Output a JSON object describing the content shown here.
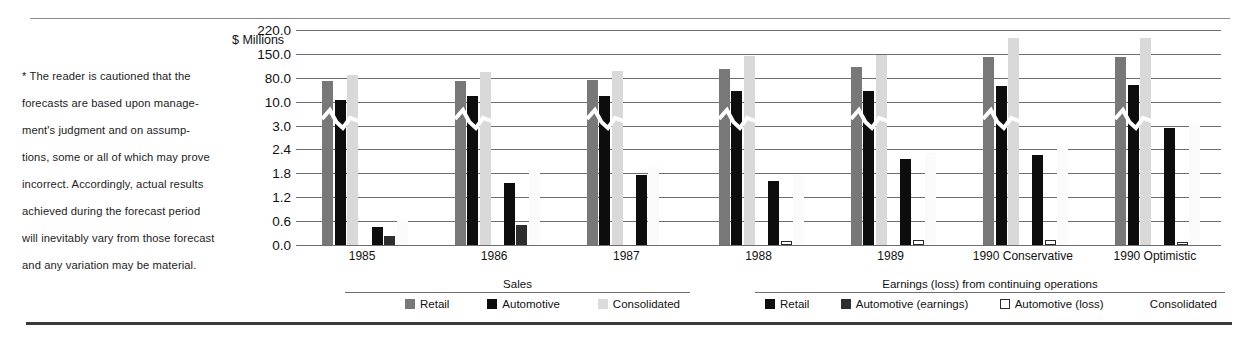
{
  "note": {
    "lines": [
      "* The reader is cautioned that the",
      "forecasts are based upon manage-",
      "ment's judgment and on assump-",
      "tions, some or all of which may prove",
      "incorrect. Accordingly, actual results",
      "achieved during the forecast period",
      "will inevitably vary from those forecast",
      "and any variation may be material."
    ]
  },
  "axis_unit_label": "$ Millions",
  "legends": {
    "sales": {
      "title": "Sales",
      "items": [
        {
          "label": "Retail",
          "swatch": "sw-retail-sales",
          "color": "#787878"
        },
        {
          "label": "Automotive",
          "swatch": "sw-auto-sales",
          "color": "#0d0d0d"
        },
        {
          "label": "Consolidated",
          "swatch": "sw-cons-sales",
          "color": "#dcdcdc"
        }
      ]
    },
    "earnings": {
      "title": "Earnings (loss) from continuing operations",
      "items": [
        {
          "label": "Retail",
          "swatch": "sw-retail-earn",
          "color": "#0d0d0d"
        },
        {
          "label": "Automotive (earnings)",
          "swatch": "sw-auto-earn",
          "color": "#2e2e2e"
        },
        {
          "label": "Automotive (loss)",
          "swatch": "sw-loss-earn",
          "color": "#ffffff"
        },
        {
          "label": "Consolidated",
          "swatch": "sw-cons-earn",
          "color": "#ffffff"
        }
      ]
    }
  },
  "chart_data": {
    "type": "bar",
    "title": "",
    "xlabel": "",
    "ylabel": "$ Millions",
    "grid": true,
    "legend_position": "bottom",
    "axis_note": "broken (non-linear) y axis; gridlines evenly spaced",
    "ytick_labels": [
      "220.0",
      "150.0",
      "80.0",
      "10.0",
      "3.0",
      "2.4",
      "1.8",
      "1.2",
      "0.6",
      "0.0"
    ],
    "ytick_values": [
      220.0,
      150.0,
      80.0,
      10.0,
      3.0,
      2.4,
      1.8,
      1.2,
      0.6,
      0.0
    ],
    "categories": [
      "1985",
      "1986",
      "1987",
      "1988",
      "1989",
      "1990 Conservative",
      "1990 Optimistic"
    ],
    "series": [
      {
        "name": "Sales - Retail",
        "group": "sales",
        "class": "b-sales-retail",
        "values": [
          72,
          70,
          73,
          105,
          112,
          140,
          140
        ]
      },
      {
        "name": "Sales - Automotive",
        "group": "sales",
        "class": "b-sales-auto",
        "values": [
          16,
          28,
          26,
          40,
          40,
          56,
          58
        ]
      },
      {
        "name": "Sales - Consolidated",
        "group": "sales",
        "class": "b-sales-cons",
        "values": [
          88,
          98,
          99,
          145,
          148,
          196,
          198
        ]
      },
      {
        "name": "Earnings - Retail",
        "group": "earnings",
        "class": "b-earn-retail",
        "values": [
          0.45,
          1.55,
          1.75,
          1.6,
          2.15,
          2.25,
          2.95
        ]
      },
      {
        "name": "Earnings - Automotive (earnings)",
        "group": "earnings",
        "class": "b-earn-auto",
        "values": [
          0.22,
          0.5,
          null,
          null,
          null,
          null,
          null
        ]
      },
      {
        "name": "Earnings - Automotive (loss)",
        "group": "earnings",
        "class": "b-earn-loss",
        "values": [
          null,
          null,
          null,
          0.1,
          0.12,
          0.12,
          0.08
        ]
      },
      {
        "name": "Earnings - Consolidated",
        "group": "earnings",
        "class": "b-earn-cons",
        "values": [
          0.6,
          1.85,
          1.95,
          1.75,
          2.3,
          2.4,
          3.05
        ]
      }
    ]
  }
}
